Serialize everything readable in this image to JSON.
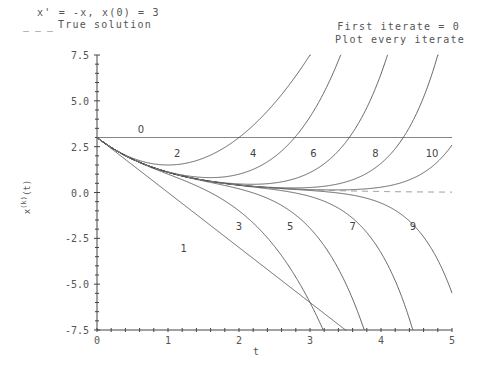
{
  "header": {
    "equation": "x' = -x, x(0) = 3",
    "legend_dash": "_ _ _",
    "legend_text": "True solution",
    "first_iterate": "First iterate = 0",
    "plot_every": "Plot every iterate"
  },
  "axes": {
    "xlabel": "t",
    "ylabel": "x(k)(t)",
    "ylabel_base": "x",
    "ylabel_sup": "(k)",
    "ylabel_tail": "(t)",
    "xticks": [
      "0",
      "1",
      "2",
      "3",
      "4",
      "5"
    ],
    "yticks": [
      "7.5",
      "5.0",
      "2.5",
      "0.0",
      "-2.5",
      "-5.0",
      "-7.5"
    ]
  },
  "colors": {
    "curve": "#555555",
    "axis": "#444444",
    "text": "#555555"
  },
  "chart_data": {
    "type": "line",
    "title": "x' = -x, x(0) = 3",
    "subtitle": "First iterate = 0; Plot every iterate",
    "xlabel": "t",
    "ylabel": "x(k)(t)",
    "xlim": [
      0,
      5
    ],
    "ylim": [
      -7.5,
      7.5
    ],
    "grid": false,
    "legend": [
      {
        "name": "True solution",
        "style": "dashed",
        "formula": "3*exp(-t)"
      }
    ],
    "x_samples": [
      0,
      0.5,
      1,
      1.5,
      2,
      2.5,
      3,
      3.5,
      4,
      4.5,
      5
    ],
    "series": [
      {
        "name": "0",
        "values": [
          3,
          3,
          3,
          3,
          3,
          3,
          3,
          3,
          3,
          3,
          3
        ]
      },
      {
        "name": "1",
        "values": [
          3,
          1.5,
          0,
          -1.5,
          -3,
          -4.5,
          -6,
          -7.5,
          null,
          null,
          null
        ]
      },
      {
        "name": "2",
        "values": [
          3,
          1.88,
          1.5,
          1.88,
          3,
          4.88,
          7.5,
          null,
          null,
          null,
          null
        ]
      },
      {
        "name": "3",
        "values": [
          3,
          1.81,
          1.0,
          0.19,
          -1.0,
          -2.94,
          -6.0,
          null,
          null,
          null,
          null
        ]
      },
      {
        "name": "4",
        "values": [
          3,
          1.82,
          1.13,
          0.82,
          1.0,
          1.94,
          4.13,
          null,
          null,
          null,
          null
        ]
      },
      {
        "name": "5",
        "values": [
          3,
          1.82,
          1.1,
          0.63,
          0.2,
          -0.51,
          -1.95,
          -4.51,
          null,
          null,
          null
        ]
      },
      {
        "name": "6",
        "values": [
          3,
          1.82,
          1.1,
          0.68,
          0.47,
          0.58,
          1.69,
          5.53,
          null,
          null,
          null
        ]
      },
      {
        "name": "7",
        "values": [
          3,
          1.82,
          1.1,
          0.67,
          0.39,
          0.16,
          -0.19,
          -1.41,
          -5.2,
          null,
          null
        ]
      },
      {
        "name": "8",
        "values": [
          3,
          1.82,
          1.1,
          0.67,
          0.41,
          0.3,
          0.5,
          1.74,
          5.0,
          null,
          null
        ]
      },
      {
        "name": "9",
        "values": [
          3,
          1.82,
          1.1,
          0.67,
          0.41,
          0.23,
          0.08,
          -0.15,
          -1.0,
          -2.9,
          -5.8
        ]
      },
      {
        "name": "10",
        "values": [
          3,
          1.82,
          1.1,
          0.67,
          0.41,
          0.25,
          0.21,
          0.29,
          0.79,
          2.5,
          null
        ]
      },
      {
        "name": "True solution",
        "values": [
          3,
          1.82,
          1.1,
          0.67,
          0.41,
          0.25,
          0.15,
          0.09,
          0.05,
          0.03,
          0.02
        ]
      }
    ],
    "curve_labels": [
      {
        "k": "0",
        "t": 0.62,
        "x": 3.45
      },
      {
        "k": "1",
        "t": 1.22,
        "x": -3.05
      },
      {
        "k": "2",
        "t": 1.13,
        "x": 2.15
      },
      {
        "k": "3",
        "t": 2.0,
        "x": -1.85
      },
      {
        "k": "4",
        "t": 2.2,
        "x": 2.15
      },
      {
        "k": "5",
        "t": 2.72,
        "x": -1.85
      },
      {
        "k": "6",
        "t": 3.05,
        "x": 2.15
      },
      {
        "k": "7",
        "t": 3.6,
        "x": -1.85
      },
      {
        "k": "8",
        "t": 3.92,
        "x": 2.15
      },
      {
        "k": "9",
        "t": 4.45,
        "x": -1.85
      },
      {
        "k": "10",
        "t": 4.72,
        "x": 2.15
      }
    ],
    "k_max": 10,
    "x0": 3
  }
}
